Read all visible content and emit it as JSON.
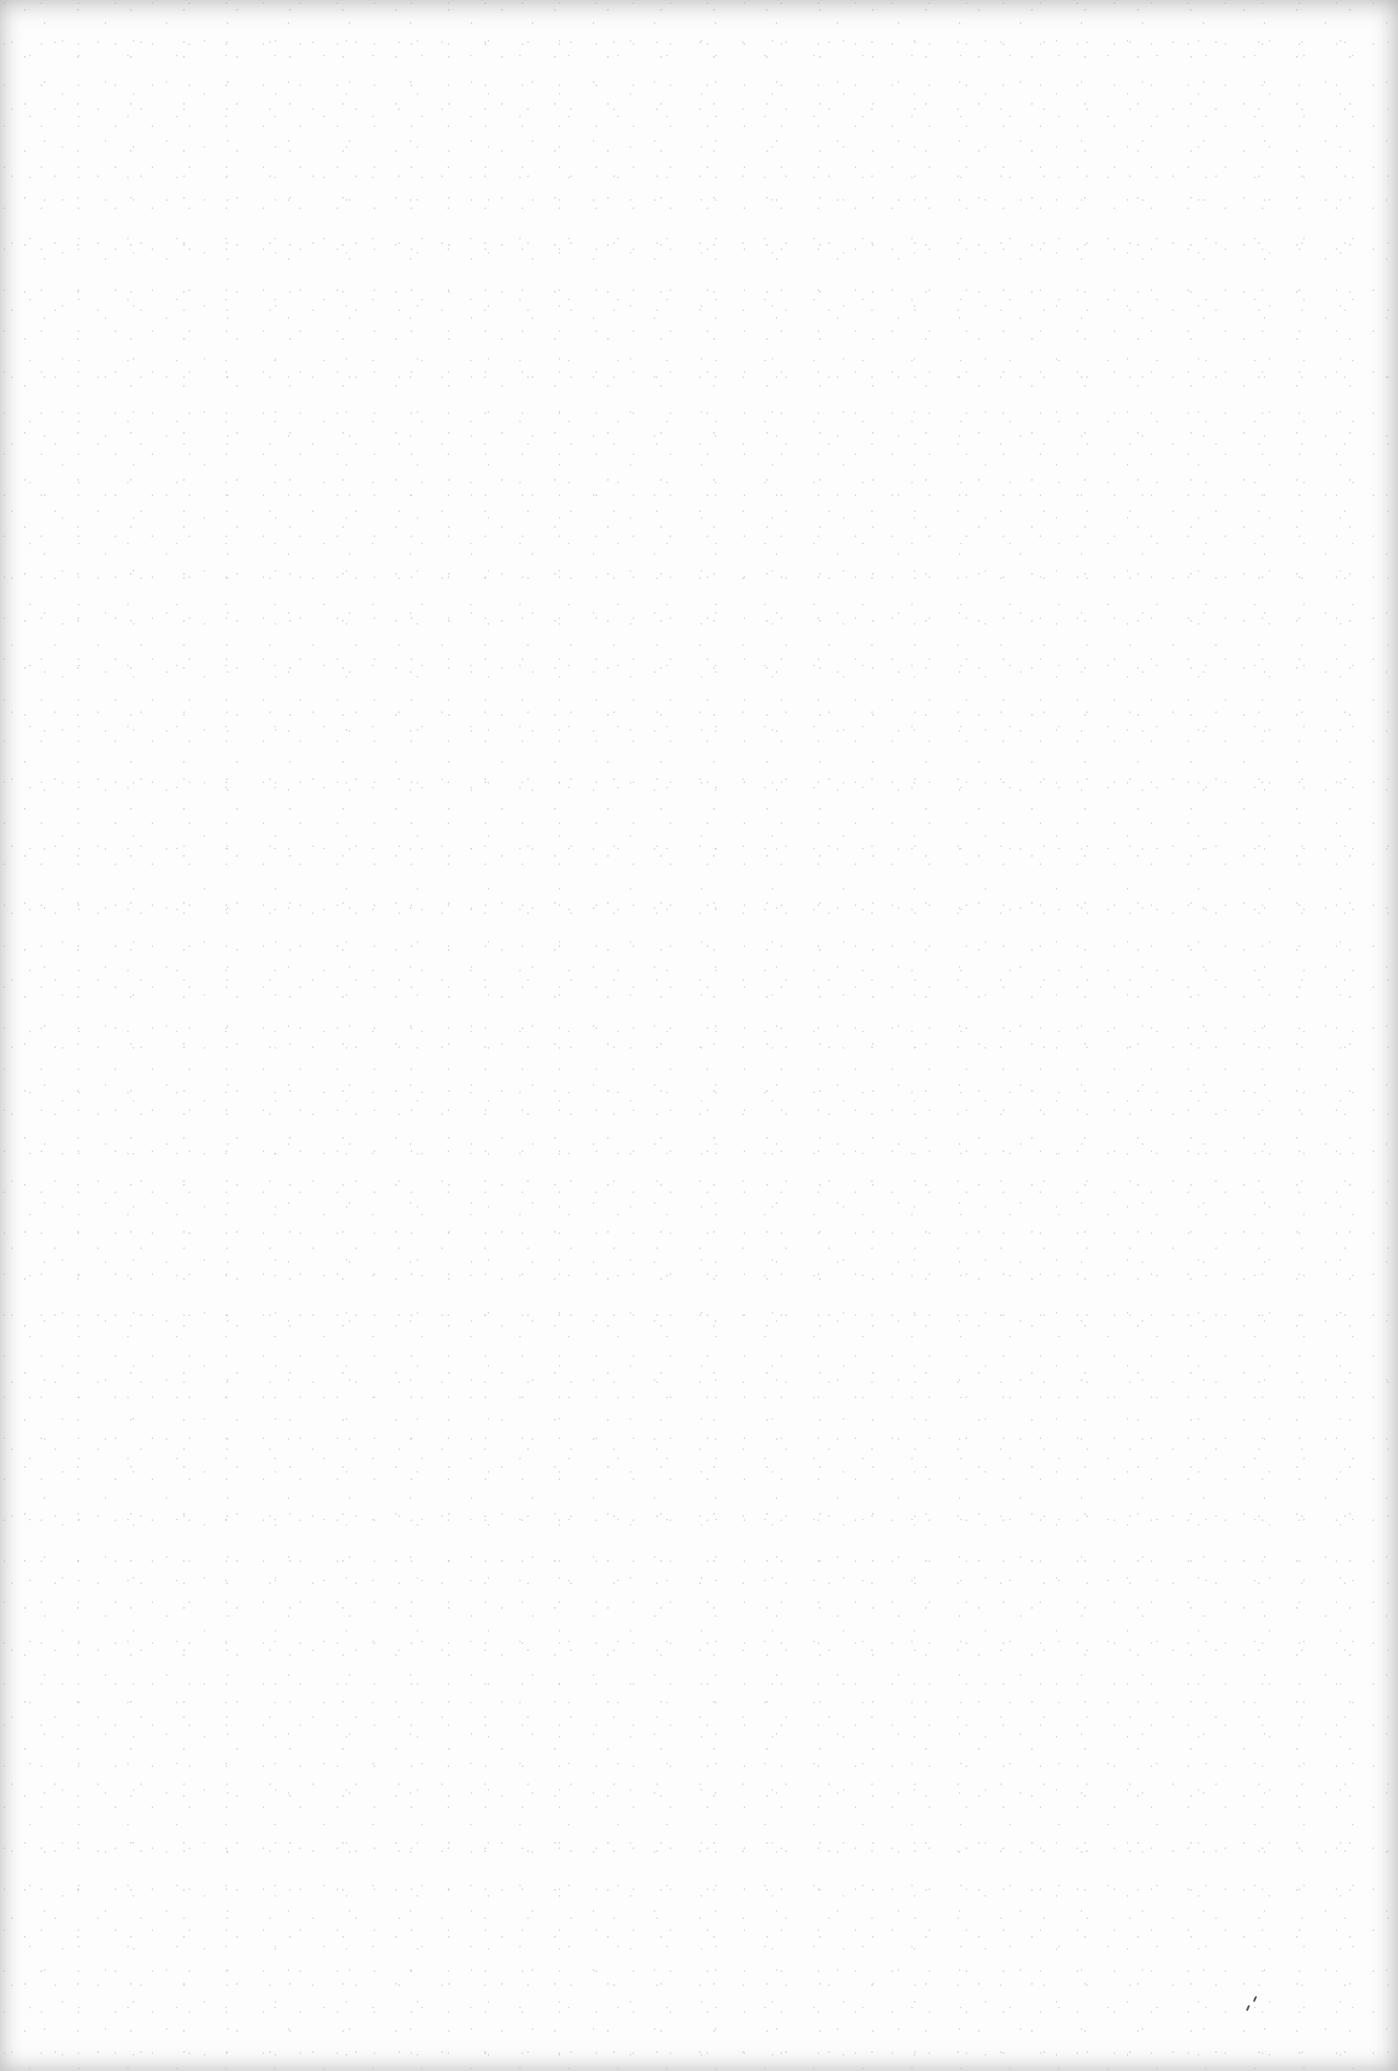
{
  "document": {
    "type": "blank-scanned-page",
    "text_content": "",
    "colors": {
      "paper": "#fdfdfd",
      "edge_shadow": "#b0b0b0",
      "speck": "#555555"
    }
  }
}
